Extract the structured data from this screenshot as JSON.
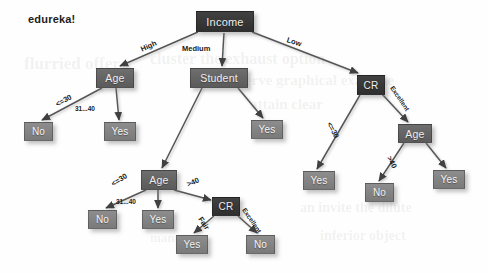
{
  "logo": {
    "text": "edureka!",
    "x": 28,
    "y": 13,
    "size": 11
  },
  "canvas": {
    "width": 488,
    "height": 273,
    "background": "#fefefe"
  },
  "palette": {
    "node_dark": "#343434",
    "node_mid": "#656565",
    "node_light": "#858585",
    "edge": "#555555",
    "label_text": "#1b1b1b",
    "node_text": "#f0f0f0"
  },
  "watermarks": [
    {
      "text": "flurried  offer",
      "x": 24,
      "y": 54,
      "size": 17
    },
    {
      "text": "cluster  the  exhaust  option",
      "x": 150,
      "y": 50,
      "size": 16
    },
    {
      "text": "reserve  graphical  example",
      "x": 226,
      "y": 72,
      "size": 15
    },
    {
      "text": "attain  clear",
      "x": 250,
      "y": 96,
      "size": 15
    },
    {
      "text": "an  invite  the  dilute",
      "x": 300,
      "y": 200,
      "size": 14
    },
    {
      "text": "inferior  object",
      "x": 320,
      "y": 228,
      "size": 14
    },
    {
      "text": "manner",
      "x": 150,
      "y": 230,
      "size": 13
    }
  ],
  "chart_data": {
    "type": "tree",
    "root": "income",
    "nodes": [
      {
        "id": "income",
        "label": "Income",
        "kind": "decision",
        "tone": "dark",
        "x": 196,
        "y": 11,
        "w": 58,
        "h": 21,
        "font": 11
      },
      {
        "id": "age_left",
        "label": "Age",
        "kind": "decision",
        "tone": "mid",
        "x": 96,
        "y": 68,
        "w": 38,
        "h": 20,
        "font": 10.5
      },
      {
        "id": "student",
        "label": "Student",
        "kind": "decision",
        "tone": "mid",
        "x": 190,
        "y": 68,
        "w": 58,
        "h": 20,
        "font": 10.5
      },
      {
        "id": "cr_right",
        "label": "CR",
        "kind": "decision",
        "tone": "dark",
        "x": 357,
        "y": 75,
        "w": 28,
        "h": 20,
        "font": 10
      },
      {
        "id": "no_l1",
        "label": "No",
        "kind": "leaf",
        "tone": "light",
        "x": 24,
        "y": 122,
        "w": 29,
        "h": 19,
        "font": 10
      },
      {
        "id": "yes_l1",
        "label": "Yes",
        "kind": "leaf",
        "tone": "light",
        "x": 104,
        "y": 122,
        "w": 32,
        "h": 19,
        "font": 10
      },
      {
        "id": "yes_student",
        "label": "Yes",
        "kind": "leaf",
        "tone": "light",
        "x": 251,
        "y": 120,
        "w": 32,
        "h": 19,
        "font": 10
      },
      {
        "id": "age_mid",
        "label": "Age",
        "kind": "decision",
        "tone": "mid",
        "x": 141,
        "y": 170,
        "w": 36,
        "h": 20,
        "font": 10.5
      },
      {
        "id": "age_right",
        "label": "Age",
        "kind": "decision",
        "tone": "mid",
        "x": 398,
        "y": 124,
        "w": 34,
        "h": 19,
        "font": 10.5
      },
      {
        "id": "yes_rc",
        "label": "Yes",
        "kind": "leaf",
        "tone": "light",
        "x": 303,
        "y": 171,
        "w": 32,
        "h": 19,
        "font": 10
      },
      {
        "id": "no_ra",
        "label": "No",
        "kind": "leaf",
        "tone": "light",
        "x": 365,
        "y": 183,
        "w": 29,
        "h": 19,
        "font": 10
      },
      {
        "id": "yes_ra",
        "label": "Yes",
        "kind": "leaf",
        "tone": "light",
        "x": 433,
        "y": 170,
        "w": 32,
        "h": 19,
        "font": 10
      },
      {
        "id": "no_m1",
        "label": "No",
        "kind": "leaf",
        "tone": "light",
        "x": 88,
        "y": 210,
        "w": 29,
        "h": 19,
        "font": 10
      },
      {
        "id": "yes_m1",
        "label": "Yes",
        "kind": "leaf",
        "tone": "light",
        "x": 142,
        "y": 210,
        "w": 32,
        "h": 19,
        "font": 10
      },
      {
        "id": "cr_bottom",
        "label": "CR",
        "kind": "decision",
        "tone": "dark",
        "x": 212,
        "y": 197,
        "w": 28,
        "h": 19,
        "font": 10
      },
      {
        "id": "yes_cb",
        "label": "Yes",
        "kind": "leaf",
        "tone": "light",
        "x": 176,
        "y": 235,
        "w": 32,
        "h": 19,
        "font": 10
      },
      {
        "id": "no_cb",
        "label": "No",
        "kind": "leaf",
        "tone": "light",
        "x": 246,
        "y": 235,
        "w": 29,
        "h": 19,
        "font": 10
      }
    ],
    "edges": [
      {
        "from": "income",
        "to": "age_left",
        "label": "High",
        "x1": 198,
        "y1": 32,
        "x2": 120,
        "y2": 66,
        "lx": 141,
        "ly": 45,
        "rot": -24
      },
      {
        "from": "income",
        "to": "student",
        "label": "Medium",
        "x1": 224,
        "y1": 33,
        "x2": 222,
        "y2": 66,
        "lx": 182,
        "ly": 44,
        "rot": 0
      },
      {
        "from": "income",
        "to": "cr_right",
        "label": "Low",
        "x1": 252,
        "y1": 32,
        "x2": 358,
        "y2": 73,
        "lx": 287,
        "ly": 35,
        "rot": 18
      },
      {
        "from": "age_left",
        "to": "no_l1",
        "label": "<=30",
        "x1": 102,
        "y1": 88,
        "x2": 42,
        "y2": 120,
        "lx": 56,
        "ly": 100,
        "rot": -28
      },
      {
        "from": "age_left",
        "to": "yes_l1",
        "label": "31...40",
        "x1": 116,
        "y1": 88,
        "x2": 119,
        "y2": 120,
        "lx": 75,
        "ly": 105,
        "rot": 0
      },
      {
        "from": "student",
        "to": "age_mid",
        "label": "",
        "x1": 202,
        "y1": 88,
        "x2": 162,
        "y2": 168,
        "lx": 0,
        "ly": 0,
        "rot": 0
      },
      {
        "from": "student",
        "to": "yes_student",
        "label": "",
        "x1": 238,
        "y1": 88,
        "x2": 263,
        "y2": 118,
        "lx": 0,
        "ly": 0,
        "rot": 0
      },
      {
        "from": "cr_right",
        "to": "yes_rc",
        "label": "<=30",
        "x1": 360,
        "y1": 95,
        "x2": 317,
        "y2": 169,
        "lx": 329,
        "ly": 118,
        "rot": 62
      },
      {
        "from": "cr_right",
        "to": "age_right",
        "label": "Excellent",
        "x1": 382,
        "y1": 94,
        "x2": 408,
        "y2": 122,
        "lx": 392,
        "ly": 83,
        "rot": 56
      },
      {
        "from": "age_right",
        "to": "no_ra",
        "label": ">40",
        "x1": 404,
        "y1": 143,
        "x2": 379,
        "y2": 181,
        "lx": 389,
        "ly": 152,
        "rot": 62
      },
      {
        "from": "age_right",
        "to": "yes_ra",
        "label": "",
        "x1": 426,
        "y1": 143,
        "x2": 446,
        "y2": 168,
        "lx": 0,
        "ly": 0,
        "rot": 0
      },
      {
        "from": "age_mid",
        "to": "no_m1",
        "label": "<=30",
        "x1": 146,
        "y1": 190,
        "x2": 106,
        "y2": 208,
        "lx": 112,
        "ly": 180,
        "rot": -33
      },
      {
        "from": "age_mid",
        "to": "yes_m1",
        "label": "31...40",
        "x1": 158,
        "y1": 190,
        "x2": 158,
        "y2": 208,
        "lx": 116,
        "ly": 198,
        "rot": 0
      },
      {
        "from": "age_mid",
        "to": "cr_bottom",
        "label": ">40",
        "x1": 174,
        "y1": 190,
        "x2": 211,
        "y2": 200,
        "lx": 187,
        "ly": 180,
        "rot": -22
      },
      {
        "from": "cr_bottom",
        "to": "yes_cb",
        "label": "Fair",
        "x1": 214,
        "y1": 216,
        "x2": 194,
        "y2": 233,
        "lx": 200,
        "ly": 213,
        "rot": 56
      },
      {
        "from": "cr_bottom",
        "to": "no_cb",
        "label": "Excellent",
        "x1": 238,
        "y1": 216,
        "x2": 257,
        "y2": 233,
        "lx": 244,
        "ly": 205,
        "rot": 56
      }
    ]
  }
}
